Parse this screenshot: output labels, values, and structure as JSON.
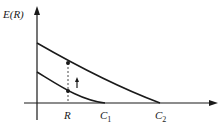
{
  "diagram": {
    "y_axis_label": "E(R)",
    "x_labels": {
      "R": "R",
      "C1_main": "C",
      "C1_sub": "1",
      "C2_main": "C",
      "C2_sub": "2"
    },
    "curves": [
      {
        "name": "upper-curve",
        "start_y_px": 43,
        "end_x_label": "C2"
      },
      {
        "name": "lower-curve",
        "start_y_px": 72,
        "end_x_label": "C1"
      }
    ],
    "marker": "upward arrow between curves at R",
    "colors": {
      "ink": "#1a1a1a",
      "background": "#ffffff"
    }
  }
}
